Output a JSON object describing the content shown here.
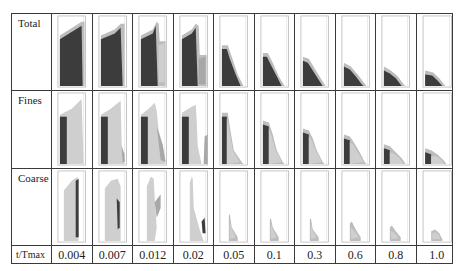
{
  "figure": {
    "row_labels": [
      "Total",
      "Fines",
      "Coarse"
    ],
    "axis_label": "t/Tmax",
    "time_values": [
      "0.004",
      "0.007",
      "0.012",
      "0.02",
      "0.05",
      "0.1",
      "0.3",
      "0.6",
      "0.8",
      "1.0"
    ]
  },
  "colors": {
    "frame": "#b8b8b8",
    "dark": "#3c3c3c",
    "mid": "#a8a8a8",
    "light": "#cfcfcf",
    "rim": "#bdbdbd",
    "grid": "#3a3a3a"
  },
  "panels": {
    "Total": [
      {
        "shapes": [
          {
            "fill": "rim",
            "pts": "8,22 30,8 33,8 33,74 8,74"
          },
          {
            "fill": "dark",
            "pts": "8,26 30,12 31,74 8,74"
          }
        ]
      },
      {
        "shapes": [
          {
            "fill": "rim",
            "pts": "8,22 22,16 28,10 32,10 32,74 8,74"
          },
          {
            "fill": "dark",
            "pts": "8,26 22,20 28,14 30,74 8,74"
          }
        ]
      },
      {
        "shapes": [
          {
            "fill": "rim",
            "pts": "8,22 20,16 24,8 26,10 27,28 33,28 33,74 8,74"
          },
          {
            "fill": "dark",
            "pts": "8,26 20,20 23,12 25,74 8,74"
          },
          {
            "fill": "light",
            "pts": "26,32 32,30 32,70 26,70"
          }
        ]
      },
      {
        "shapes": [
          {
            "fill": "rim",
            "pts": "8,22 18,16 22,10 25,12 26,42 33,42 33,74 8,74"
          },
          {
            "fill": "dark",
            "pts": "8,26 18,20 22,14 24,74 8,74"
          },
          {
            "fill": "mid",
            "pts": "25,46 32,44 32,72 25,72"
          }
        ]
      },
      {
        "shapes": [
          {
            "fill": "rim",
            "pts": "8,32 14,32 18,44 24,62 30,74 8,74"
          },
          {
            "fill": "dark",
            "pts": "8,36 13,36 16,46 22,62 27,74 8,74"
          }
        ]
      },
      {
        "shapes": [
          {
            "fill": "rim",
            "pts": "8,40 13,40 18,50 24,64 30,74 8,74"
          },
          {
            "fill": "dark",
            "pts": "8,44 12,44 16,52 22,64 27,74 8,74"
          }
        ]
      },
      {
        "shapes": [
          {
            "fill": "rim",
            "pts": "8,44 14,46 20,56 26,66 31,74 8,74"
          },
          {
            "fill": "dark",
            "pts": "8,48 13,50 18,58 23,66 28,74 8,74"
          }
        ]
      },
      {
        "shapes": [
          {
            "fill": "rim",
            "pts": "8,50 15,54 22,62 28,70 31,74 8,74"
          },
          {
            "fill": "dark",
            "pts": "8,54 14,57 20,64 26,72 28,74 8,74"
          }
        ]
      },
      {
        "shapes": [
          {
            "fill": "rim",
            "pts": "8,54 15,58 22,64 28,72 30,74 8,74"
          },
          {
            "fill": "dark",
            "pts": "8,58 14,61 20,66 26,74 8,74"
          }
        ]
      },
      {
        "shapes": [
          {
            "fill": "rim",
            "pts": "8,58 16,60 22,66 28,74 8,74"
          },
          {
            "fill": "dark",
            "pts": "8,62 15,63 20,68 25,74 8,74"
          }
        ]
      }
    ],
    "Fines": [
      {
        "shapes": [
          {
            "fill": "light",
            "pts": "8,24 20,18 30,8 32,74 8,74"
          },
          {
            "fill": "dark",
            "pts": "8,26 15,26 15,74 8,74"
          }
        ]
      },
      {
        "shapes": [
          {
            "fill": "light",
            "pts": "8,24 18,18 28,10 29,54 32,70 32,74 8,74"
          },
          {
            "fill": "dark",
            "pts": "8,26 15,26 15,74 8,74"
          },
          {
            "fill": "mid",
            "pts": "29,56 32,64 32,72 30,72"
          }
        ]
      },
      {
        "shapes": [
          {
            "fill": "light",
            "pts": "8,24 16,18 22,12 24,20 26,40 32,64 33,74 8,74"
          },
          {
            "fill": "dark",
            "pts": "8,26 15,26 15,74 8,74"
          },
          {
            "fill": "mid",
            "pts": "24,36 30,54 33,72 28,70"
          }
        ]
      },
      {
        "shapes": [
          {
            "fill": "light",
            "pts": "8,22 18,16 22,14 23,30 24,56 28,74 8,74"
          },
          {
            "fill": "dark",
            "pts": "8,26 15,26 15,74 8,74"
          },
          {
            "fill": "mid",
            "pts": "31,46 34,44 34,74 30,74"
          }
        ]
      },
      {
        "shapes": [
          {
            "fill": "rim",
            "pts": "8,22 14,22 16,36 20,60 28,72 30,74 8,74"
          },
          {
            "fill": "dark",
            "pts": "8,26 13,26 13,74 8,74"
          },
          {
            "fill": "light",
            "pts": "13,28 15,36 19,60 26,72 13,74"
          }
        ]
      },
      {
        "shapes": [
          {
            "fill": "rim",
            "pts": "8,30 14,32 18,44 22,60 28,72 30,74 8,74"
          },
          {
            "fill": "dark",
            "pts": "8,34 14,36 14,74 8,74"
          },
          {
            "fill": "light",
            "pts": "14,38 17,46 21,60 27,72 14,74"
          }
        ]
      },
      {
        "shapes": [
          {
            "fill": "rim",
            "pts": "8,38 14,40 18,48 22,60 28,72 30,74 8,74"
          },
          {
            "fill": "dark",
            "pts": "8,42 14,44 14,74 8,74"
          },
          {
            "fill": "light",
            "pts": "14,46 17,50 21,60 27,72 14,74"
          }
        ]
      },
      {
        "shapes": [
          {
            "fill": "rim",
            "pts": "8,44 14,46 18,52 24,62 29,72 31,74 8,74"
          },
          {
            "fill": "dark",
            "pts": "8,48 14,50 14,74 8,74"
          },
          {
            "fill": "light",
            "pts": "14,52 17,54 22,62 28,72 14,74"
          }
        ]
      },
      {
        "shapes": [
          {
            "fill": "rim",
            "pts": "8,54 14,56 20,62 26,68 30,74 8,74"
          },
          {
            "fill": "dark",
            "pts": "8,58 14,60 14,74 8,74"
          },
          {
            "fill": "light",
            "pts": "14,62 19,64 24,68 28,74 14,74"
          }
        ]
      },
      {
        "shapes": [
          {
            "fill": "rim",
            "pts": "8,58 14,60 20,64 26,70 29,74 8,74"
          },
          {
            "fill": "dark",
            "pts": "8,62 14,64 14,74 8,74"
          },
          {
            "fill": "light",
            "pts": "14,66 19,66 24,70 27,74 14,74"
          }
        ]
      }
    ],
    "Coarse": [
      {
        "shapes": [
          {
            "fill": "light",
            "pts": "12,22 20,12 26,8 27,74 12,74"
          },
          {
            "fill": "dark",
            "pts": "24,12 27,10 27,70 24,70"
          }
        ]
      },
      {
        "shapes": [
          {
            "fill": "light",
            "pts": "12,20 18,12 25,10 28,18 28,74 12,74"
          },
          {
            "fill": "dark",
            "pts": "24,30 27,34 27,60 25,62"
          }
        ]
      },
      {
        "shapes": [
          {
            "fill": "light",
            "pts": "14,18 18,8 21,10 22,30 24,60 22,74 14,74"
          },
          {
            "fill": "mid",
            "pts": "22,34 28,26 28,40 24,50"
          }
        ]
      },
      {
        "shapes": [
          {
            "fill": "light",
            "pts": "16,14 18,8 19,10 20,40 26,62 30,74 16,74"
          },
          {
            "fill": "dark",
            "pts": "28,54 31,50 32,66 29,66"
          }
        ]
      },
      {
        "shapes": [
          {
            "fill": "rim",
            "pts": "15,48 16,46 18,60 24,70 24,74 15,74"
          },
          {
            "fill": "light",
            "pts": "16,52 18,62 22,70 16,72"
          }
        ]
      },
      {
        "shapes": [
          {
            "fill": "rim",
            "pts": "15,52 16,50 18,60 24,70 24,74 15,74"
          },
          {
            "fill": "light",
            "pts": "16,56 18,62 22,70 16,72"
          }
        ]
      },
      {
        "shapes": [
          {
            "fill": "rim",
            "pts": "15,52 16,50 18,62 24,70 24,74 15,74"
          },
          {
            "fill": "light",
            "pts": "16,56 18,64 22,70 16,72"
          }
        ]
      },
      {
        "shapes": [
          {
            "fill": "rim",
            "pts": "14,56 16,54 20,62 25,70 25,74 14,74"
          },
          {
            "fill": "light",
            "pts": "15,60 19,64 23,70 15,72"
          }
        ]
      },
      {
        "shapes": [
          {
            "fill": "rim",
            "pts": "14,60 16,58 20,64 25,70 25,74 14,74"
          },
          {
            "fill": "light",
            "pts": "15,63 19,66 23,71 15,72"
          }
        ]
      },
      {
        "shapes": [
          {
            "fill": "rim",
            "pts": "14,64 18,62 22,66 25,72 25,74 14,74"
          },
          {
            "fill": "light",
            "pts": "15,66 18,65 22,68 23,72 15,72"
          }
        ]
      }
    ]
  }
}
